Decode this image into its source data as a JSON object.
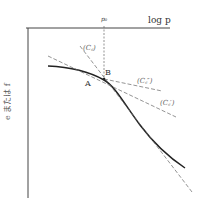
{
  "figure": {
    "x_axis_label": "log p",
    "y_axis_label": "e または f",
    "p0_label": "p₀",
    "point_A_label": "A",
    "point_B_label": "B",
    "tangent_labels": {
      "c1": "(C꜀)",
      "c2": "(C꜀″)",
      "c3": "(C꜀′)"
    }
  },
  "colors": {
    "axis": "#444444",
    "curve": "#222222",
    "dashed": "#666666",
    "background": "#ffffff"
  }
}
